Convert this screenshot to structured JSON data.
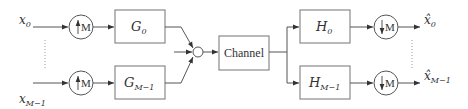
{
  "inputs": [
    {
      "symbol": "x",
      "subscript": "0"
    },
    {
      "symbol": "x",
      "subscript": "M−1"
    }
  ],
  "upsamplers": [
    {
      "label": "M",
      "direction": "up-arrow-icon"
    },
    {
      "label": "M",
      "direction": "up-arrow-icon"
    }
  ],
  "synthesis_filters": [
    {
      "symbol": "G",
      "subscript": "0"
    },
    {
      "symbol": "G",
      "subscript": "M−1"
    }
  ],
  "channel": {
    "label": "Channel"
  },
  "analysis_filters": [
    {
      "symbol": "H",
      "subscript": "0"
    },
    {
      "symbol": "H",
      "subscript": "M−1"
    }
  ],
  "downsamplers": [
    {
      "label": "M",
      "direction": "down-arrow-icon"
    },
    {
      "label": "M",
      "direction": "down-arrow-icon"
    }
  ],
  "outputs": [
    {
      "symbol": "x̂",
      "subscript": "0"
    },
    {
      "symbol": "x̂",
      "subscript": "M−1"
    }
  ]
}
